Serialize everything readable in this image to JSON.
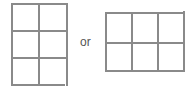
{
  "diagram": {
    "connector_text": "or",
    "stroke_color": "#8a8a8a",
    "grids": [
      {
        "name": "tall-grid",
        "rows": 3,
        "cols": 2
      },
      {
        "name": "wide-grid",
        "rows": 2,
        "cols": 3
      }
    ]
  }
}
